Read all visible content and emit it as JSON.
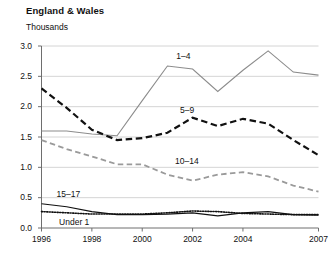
{
  "header": {
    "title": "England & Wales",
    "units": "Thousands"
  },
  "chart_data": {
    "type": "line",
    "title": "England & Wales",
    "subtitle": "Thousands",
    "xlabel": "",
    "ylabel": "Thousands",
    "xlim": [
      1996,
      2007
    ],
    "ylim": [
      0.0,
      3.0
    ],
    "grid": true,
    "legend": "inline-annotations",
    "y_ticks": [
      "0.0",
      "0.5",
      "1.0",
      "1.5",
      "2.0",
      "2.5",
      "3.0"
    ],
    "y_tick_values": [
      0.0,
      0.5,
      1.0,
      1.5,
      2.0,
      2.5,
      3.0
    ],
    "x_ticks": [
      "1996",
      "1998",
      "2000",
      "2002",
      "2004",
      "2007"
    ],
    "x_tick_values": [
      1996,
      1998,
      2000,
      2002,
      2004,
      2007
    ],
    "x": [
      1996,
      1997,
      1998,
      1999,
      2000,
      2001,
      2002,
      2003,
      2004,
      2005,
      2006,
      2007
    ],
    "series": [
      {
        "name": "1-4",
        "label": "1–4",
        "color": "#8c8c8c",
        "style": "solid",
        "width": 1.1,
        "label_x": 2001.35,
        "label_y": 2.82,
        "values": [
          1.6,
          1.6,
          1.55,
          1.52,
          2.1,
          2.67,
          2.62,
          2.25,
          2.6,
          2.92,
          2.57,
          2.52
        ]
      },
      {
        "name": "5-9",
        "label": "5–9",
        "color": "#111111",
        "style": "dashed",
        "width": 2.2,
        "label_x": 2001.5,
        "label_y": 1.93,
        "values": [
          2.3,
          1.98,
          1.62,
          1.45,
          1.48,
          1.57,
          1.82,
          1.68,
          1.8,
          1.72,
          1.45,
          1.2
        ]
      },
      {
        "name": "10-14",
        "label": "10–14",
        "color": "#9a9a9a",
        "style": "dashed",
        "width": 1.8,
        "label_x": 2001.3,
        "label_y": 1.1,
        "values": [
          1.45,
          1.3,
          1.18,
          1.05,
          1.05,
          0.88,
          0.78,
          0.88,
          0.92,
          0.85,
          0.7,
          0.6
        ]
      },
      {
        "name": "15-17",
        "label": "15–17",
        "color": "#111111",
        "style": "solid",
        "width": 1.2,
        "label_x": 1996.6,
        "label_y": 0.56,
        "values": [
          0.4,
          0.35,
          0.27,
          0.22,
          0.22,
          0.23,
          0.25,
          0.2,
          0.25,
          0.27,
          0.22,
          0.21
        ]
      },
      {
        "name": "Under 1",
        "label": "Under 1",
        "color": "#111111",
        "style": "dotted",
        "width": 1.6,
        "label_x": 1996.7,
        "label_y": 0.09,
        "values": [
          0.27,
          0.25,
          0.23,
          0.23,
          0.23,
          0.25,
          0.28,
          0.27,
          0.24,
          0.23,
          0.22,
          0.22
        ]
      }
    ]
  },
  "axis_colors": {
    "grid": "#c9c9c9",
    "axis": "#6e6e6e",
    "text": "#111111"
  }
}
